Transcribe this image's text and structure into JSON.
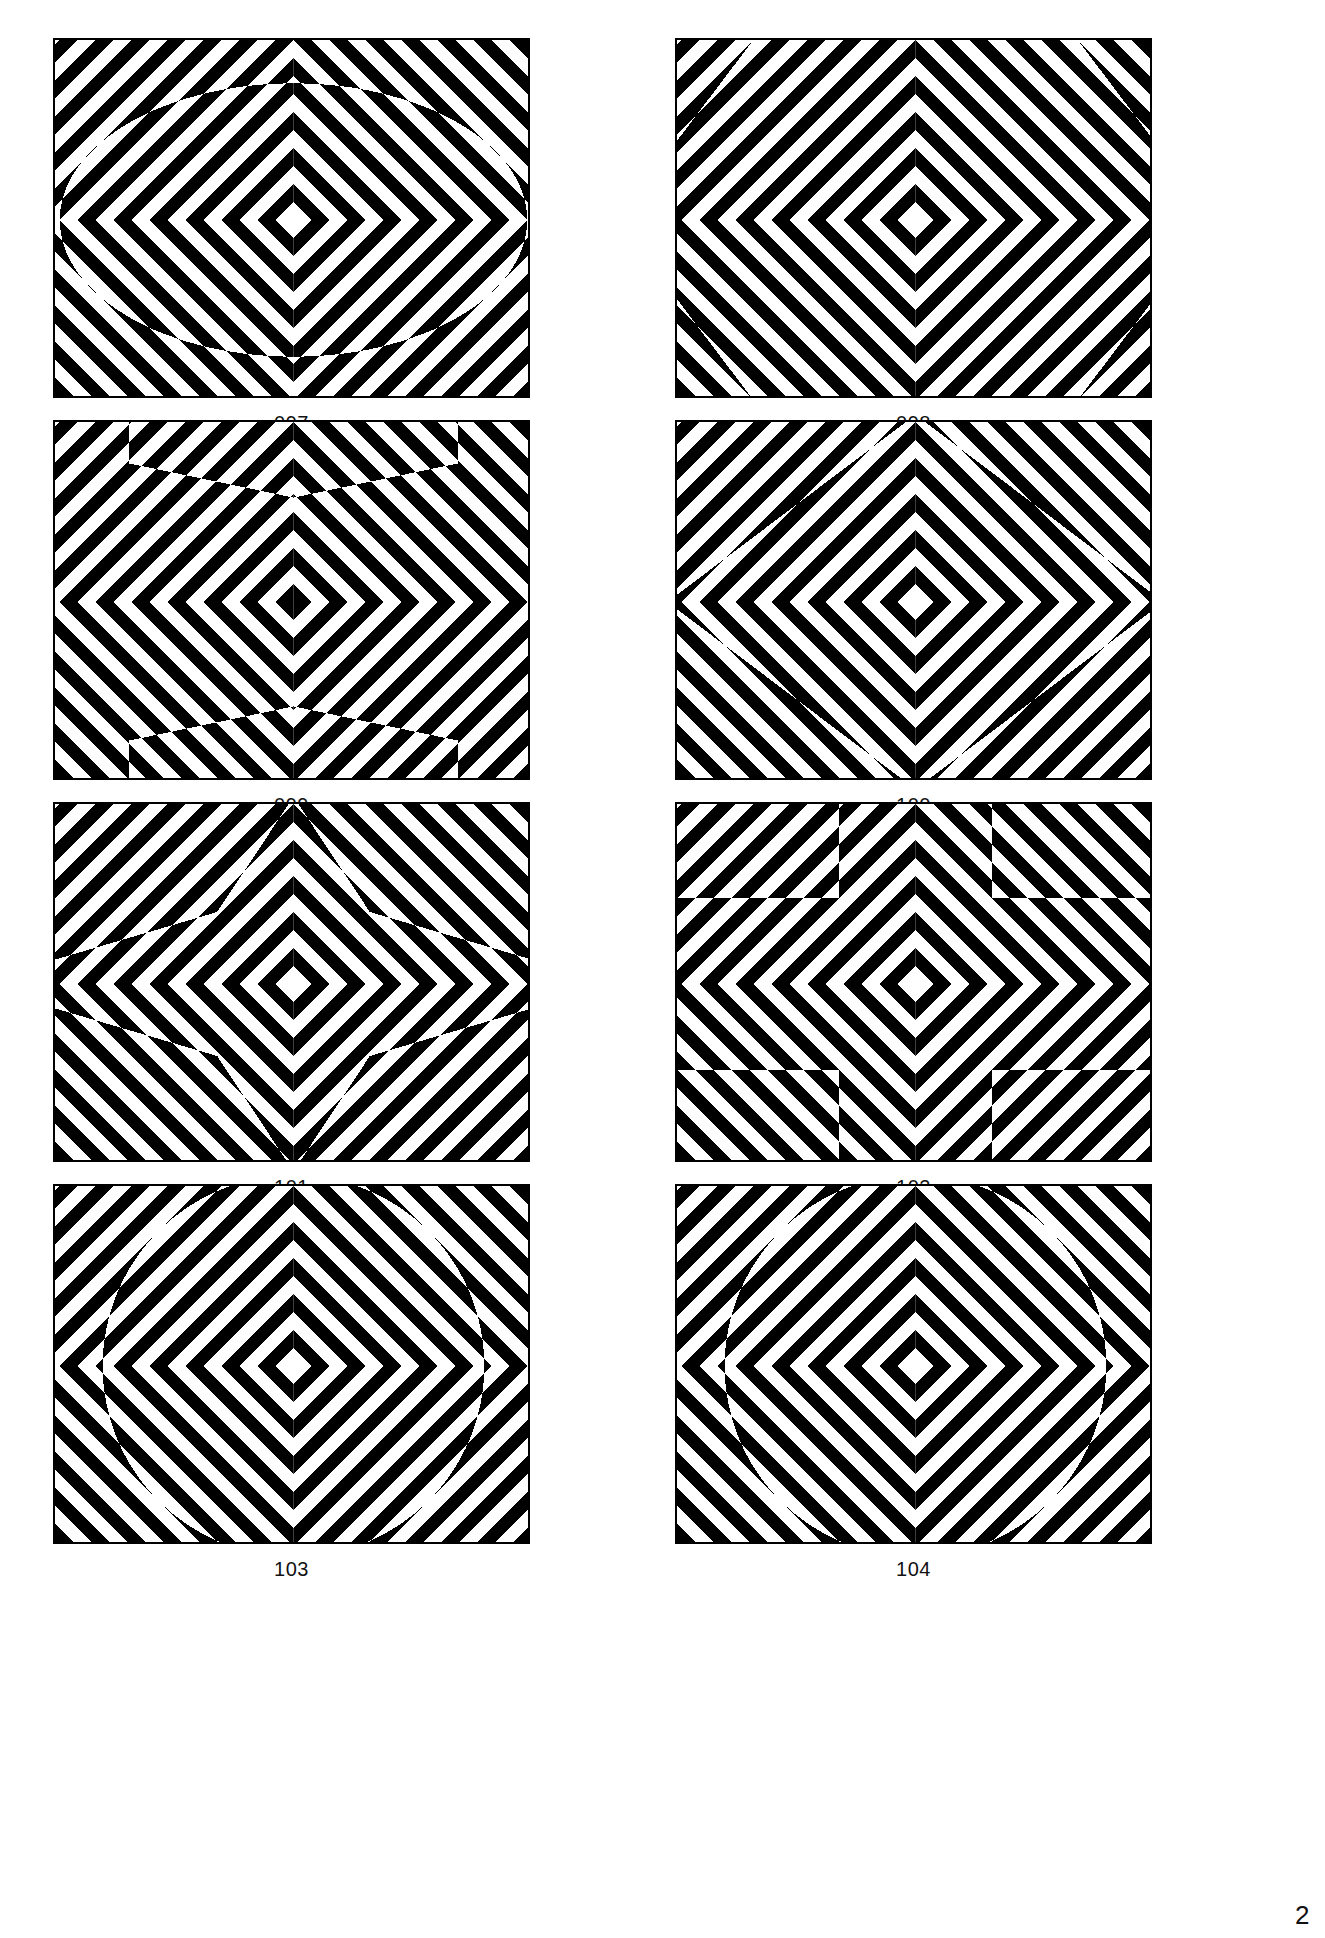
{
  "document": {
    "kind": "op-art-plate-sheet",
    "page_number_partial": "2",
    "background_color": "#ffffff",
    "ink_color": "#000000",
    "columns": 2,
    "rows": 4
  },
  "layout": {
    "panel_width": 477,
    "panel_height": 360,
    "col_x": [
      53,
      675
    ],
    "row_y": [
      38,
      420,
      802,
      1184
    ],
    "caption_offset": 14
  },
  "pattern": {
    "description": "45-degree chevron stripe field mirrored into four quadrants forming a central X; a masked interior region shows the same field with inverted stripe phase",
    "stripe_period": 36,
    "stripe_duty": 0.5,
    "center_x_fraction": 0.5,
    "center_y_fraction": 0.5
  },
  "panels": [
    {
      "id": "097",
      "caption": "097",
      "mask_name": "ellipse",
      "mask_label": "wide ellipse",
      "mask": {
        "type": "ellipse",
        "cx": 0.5,
        "cy": 0.5,
        "rx": 0.49,
        "ry": 0.38
      }
    },
    {
      "id": "098",
      "caption": "098",
      "mask_name": "octagon",
      "mask_label": "octagon",
      "mask": {
        "type": "polygon",
        "points": "0.16,0.0 0.84,0.0 1.0,0.28 1.0,0.72 0.84,1.0 0.16,1.0 0.0,0.72 0.0,0.28"
      }
    },
    {
      "id": "099",
      "caption": "099",
      "mask_name": "tall-rectangle",
      "mask_label": "tall rectangle with pointed ends",
      "mask": {
        "type": "polygon",
        "points": "0.155,0.0 0.845,0.0 0.845,0.115 0.5,0.21 0.155,0.115 0.155,0.885 0.5,0.79 0.845,0.885 0.845,1.0 0.155,1.0"
      }
    },
    {
      "id": "100",
      "caption": "100",
      "mask_name": "diamond",
      "mask_label": "diamond",
      "mask": {
        "type": "polygon",
        "points": "0.5,-0.02 1.02,0.5 0.5,1.02 -0.02,0.5"
      }
    },
    {
      "id": "101",
      "caption": "101",
      "mask_name": "six-point-star",
      "mask_label": "six pointed star",
      "mask": {
        "type": "polygon",
        "points": "0.5,-0.02 0.66,0.30 1.02,0.44 1.02,0.56 0.66,0.70 0.5,1.02 0.34,0.70 -0.02,0.56 -0.02,0.44 0.34,0.30"
      }
    },
    {
      "id": "102",
      "caption": "102",
      "mask_name": "plus-cross",
      "mask_label": "plus cross",
      "mask": {
        "type": "polygon",
        "points": "0.34,0.0 0.66,0.0 0.66,0.26 1.0,0.26 1.0,0.74 0.66,0.74 0.66,1.0 0.34,1.0 0.34,0.74 0.0,0.74 0.0,0.26 0.34,0.26"
      }
    },
    {
      "id": "103",
      "caption": "103",
      "mask_name": "circle",
      "mask_label": "large circle",
      "mask": {
        "type": "ellipse",
        "cx": 0.5,
        "cy": 0.5,
        "rx": 0.4,
        "ry": 0.53
      }
    },
    {
      "id": "104",
      "caption": "104",
      "mask_name": "circle-rectangle-union",
      "mask_label": "circle overlaid with upright rectangle",
      "mask": {
        "type": "circle-rect",
        "cx": 0.5,
        "cy": 0.5,
        "rx": 0.4,
        "ry": 0.53,
        "rect_x": 0.24,
        "rect_y": 0.17,
        "rect_w": 0.52,
        "rect_h": 0.66
      }
    }
  ]
}
